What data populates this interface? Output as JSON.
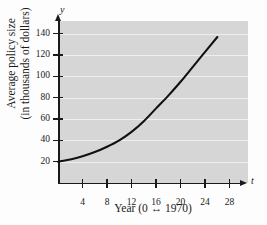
{
  "chart_data": {
    "type": "line",
    "title": "",
    "xlabel": "Year (0 ↔ 1970)",
    "ylabel_line1": "Average policy size",
    "ylabel_line2": "(in thousands of dollars)",
    "x_axis_variable": "t",
    "y_axis_variable": "y",
    "xlim": [
      0,
      31
    ],
    "ylim": [
      0,
      152
    ],
    "xticks": [
      4,
      8,
      12,
      16,
      20,
      24,
      28
    ],
    "xtick_labels": [
      "4",
      "8",
      "12",
      "16",
      "20",
      "24",
      "28"
    ],
    "yticks": [
      20,
      40,
      60,
      80,
      100,
      120,
      140
    ],
    "ytick_labels": [
      "20",
      "40",
      "60",
      "80",
      "100",
      "120",
      "140"
    ],
    "grid": true,
    "grid_orientation": "horizontal",
    "plot_background_color": "#d6d6d6",
    "gridline_color": "#efefef",
    "curve_color": "#111111",
    "curve_width": 2.1,
    "series": [
      {
        "name": "Average policy size",
        "x": [
          0,
          2,
          4,
          6,
          8,
          10,
          12,
          14,
          16,
          18,
          20,
          22,
          24,
          26
        ],
        "y": [
          20,
          22,
          25,
          29,
          34,
          40,
          48,
          58,
          70,
          82,
          95,
          109,
          123,
          137
        ]
      }
    ]
  }
}
